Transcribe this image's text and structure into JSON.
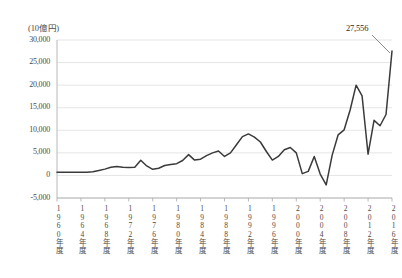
{
  "chart_data": {
    "type": "line",
    "title": "",
    "subtitle": "",
    "unit_label": "(10億円)",
    "xlabel": "",
    "ylabel": "",
    "ylim": [
      -5000,
      30000
    ],
    "ytick_values": [
      30000,
      25000,
      20000,
      15000,
      10000,
      5000,
      0,
      -5000
    ],
    "ytick_labels": [
      "30,000",
      "25,000",
      "20,000",
      "15,000",
      "10,000",
      "5,000",
      "0",
      "-5,000"
    ],
    "grid": true,
    "legend": "none",
    "xtick_labels": [
      "1960年度",
      "1964年度",
      "1968年度",
      "1972年度",
      "1976年度",
      "1980年度",
      "1984年度",
      "1988年度",
      "1992年度",
      "1996年度",
      "2000年度",
      "2004年度",
      "2008年度",
      "2012年度",
      "2016年度"
    ],
    "xtick_years": [
      1960,
      1964,
      1968,
      1972,
      1976,
      1980,
      1984,
      1988,
      1992,
      1996,
      2000,
      2004,
      2008,
      2012,
      2016
    ],
    "xlim": [
      1960,
      2016
    ],
    "annotations": [
      {
        "label": "27,556",
        "x": 2016,
        "y": 27556
      }
    ],
    "series": [
      {
        "name": "",
        "color": "#3a3a3a",
        "x": [
          1960,
          1961,
          1962,
          1963,
          1964,
          1965,
          1966,
          1967,
          1968,
          1969,
          1970,
          1971,
          1972,
          1973,
          1974,
          1975,
          1976,
          1977,
          1978,
          1979,
          1980,
          1981,
          1982,
          1983,
          1984,
          1985,
          1986,
          1987,
          1988,
          1989,
          1990,
          1991,
          1992,
          1993,
          1994,
          1995,
          1996,
          1997,
          1998,
          1999,
          2000,
          2001,
          2002,
          2003,
          2004,
          2005,
          2006,
          2007,
          2008,
          2009,
          2010,
          2011,
          2012,
          2013,
          2014,
          2015,
          2016
        ],
        "values": [
          700,
          700,
          700,
          700,
          700,
          700,
          800,
          1100,
          1400,
          1800,
          2000,
          1800,
          1750,
          1800,
          3350,
          2100,
          1350,
          1600,
          2200,
          2400,
          2600,
          3300,
          4600,
          3400,
          3600,
          4400,
          5000,
          5400,
          4200,
          5000,
          6800,
          8600,
          9200,
          8500,
          7400,
          5300,
          3400,
          4200,
          5700,
          6200,
          5000,
          400,
          900,
          4200,
          300,
          -2100,
          4500,
          9000,
          10100,
          14500,
          20000,
          17600,
          4700,
          12200,
          11000,
          13500,
          27556
        ]
      }
    ]
  }
}
